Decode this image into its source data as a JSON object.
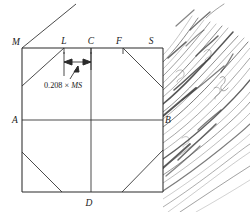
{
  "figure": {
    "ink_color": "#2b2b2b",
    "background_color": "#ffffff",
    "vertex_labels": [
      {
        "id": "M",
        "text": "M",
        "x": 16,
        "y": 45,
        "position": "top-left-corner"
      },
      {
        "id": "L",
        "text": "L",
        "x": 64,
        "y": 44,
        "position": "top-edge"
      },
      {
        "id": "C",
        "text": "C",
        "x": 91,
        "y": 44,
        "position": "top-center"
      },
      {
        "id": "F",
        "text": "F",
        "x": 119,
        "y": 44,
        "position": "top-edge"
      },
      {
        "id": "S",
        "text": "S",
        "x": 151,
        "y": 44,
        "position": "top-right-corner"
      },
      {
        "id": "A",
        "text": "A",
        "x": 15,
        "y": 123,
        "position": "left-mid"
      },
      {
        "id": "B",
        "text": "B",
        "x": 166,
        "y": 123,
        "position": "right-mid"
      },
      {
        "id": "D",
        "text": "D",
        "x": 89,
        "y": 205,
        "position": "bottom-center"
      }
    ],
    "dimension": {
      "value": "0.208",
      "operator": "×",
      "reference": "MS",
      "full_text": "0.208 × MS",
      "spans_from": "L",
      "spans_to": "C",
      "arrow_style": "double-headed",
      "leader_from_x": 70,
      "leader_from_y": 79,
      "leader_to_x": 78,
      "leader_to_y": 66
    },
    "geometry": {
      "rect_left": 22,
      "rect_top": 48,
      "rect_right": 163,
      "rect_bottom": 192,
      "midline_y": 120,
      "center_x": 91,
      "tick_L_x": 64,
      "tick_F_x": 123,
      "dim_arrow_y": 62
    },
    "texture": {
      "name": "wood-grain-hatching",
      "side": "right",
      "stroke_angle_label": "45-degree rising"
    }
  }
}
